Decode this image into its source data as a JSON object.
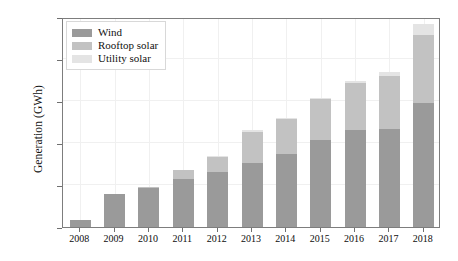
{
  "chart_data": {
    "type": "bar",
    "stacked": true,
    "title": "",
    "subtitle": "",
    "xlabel": "",
    "ylabel": "Generation (GWh)",
    "categories": [
      "2008",
      "2009",
      "2010",
      "2011",
      "2012",
      "2013",
      "2014",
      "2015",
      "2016",
      "2017",
      "2018"
    ],
    "series": [
      {
        "name": "Wind",
        "color": "#9a9a9a",
        "values": [
          850,
          3900,
          4650,
          5700,
          6500,
          7600,
          8700,
          10300,
          11500,
          11700,
          14800
        ]
      },
      {
        "name": "Rooftop solar",
        "color": "#c2c2c2",
        "values": [
          0,
          0,
          150,
          1050,
          1850,
          3750,
          4100,
          4900,
          5600,
          6300,
          8100
        ]
      },
      {
        "name": "Utility solar",
        "color": "#e4e4e4",
        "values": [
          0,
          0,
          0,
          0,
          150,
          150,
          150,
          200,
          300,
          400,
          1300
        ]
      }
    ],
    "totals": [
      850,
      3900,
      4800,
      6750,
      8500,
      11500,
      12950,
      15400,
      17400,
      18400,
      24200
    ],
    "ylim": [
      0,
      25000
    ],
    "yticks": [
      0,
      5000,
      10000,
      15000,
      20000,
      25000
    ],
    "ytick_labels": [
      "0",
      "5000",
      "10000",
      "15000",
      "20000",
      "25000"
    ],
    "grid": true,
    "grid_color": "#f0f0f0",
    "legend_position": "upper left",
    "frame_color": "#7d7d7d",
    "background": "#ffffff"
  },
  "legend": {
    "items": [
      {
        "label": "Wind",
        "swatch_name": "legend-swatch-wind"
      },
      {
        "label": "Rooftop solar",
        "swatch_name": "legend-swatch-rooftop-solar"
      },
      {
        "label": "Utility solar",
        "swatch_name": "legend-swatch-utility-solar"
      }
    ]
  }
}
